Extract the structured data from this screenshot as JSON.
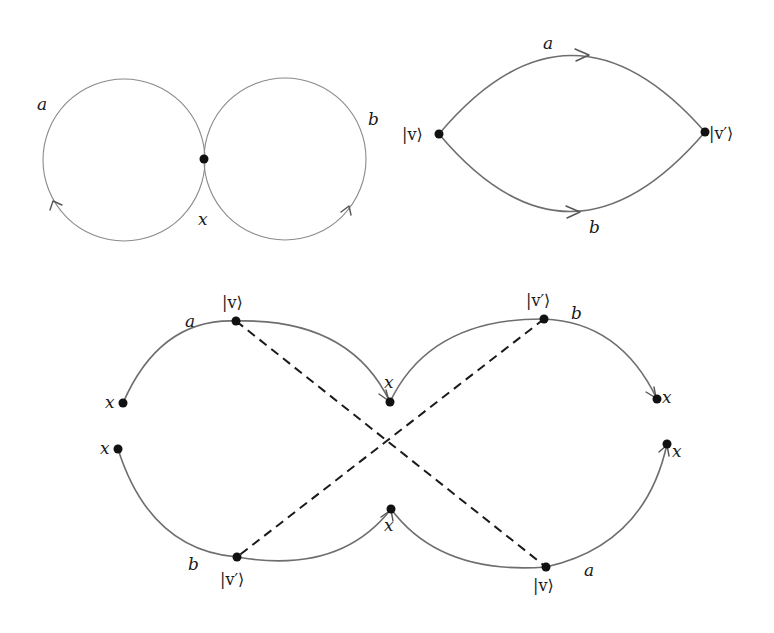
{
  "figure_eight": {
    "loop_left_label": "a",
    "loop_right_label": "b",
    "vertex_label": "x"
  },
  "lens": {
    "top_edge_label": "a",
    "bottom_edge_label": "b",
    "left_vertex_label": "|v⟩",
    "right_vertex_label": "|v′⟩"
  },
  "cover": {
    "top_left_arc_label": "a",
    "top_left_vertex": "|v⟩",
    "top_right_arc_label": "b",
    "top_right_vertex": "|v′⟩",
    "bottom_left_arc_label": "b",
    "bottom_left_vertex": "|v′⟩",
    "bottom_right_arc_label": "a",
    "bottom_right_vertex": "|v⟩",
    "endpoint_label": "x"
  },
  "colors": {
    "edge": "#6e6e6e",
    "thin_edge": "#8a8a8a",
    "vertex": "#111111",
    "dashed": "#1a1a1a"
  }
}
